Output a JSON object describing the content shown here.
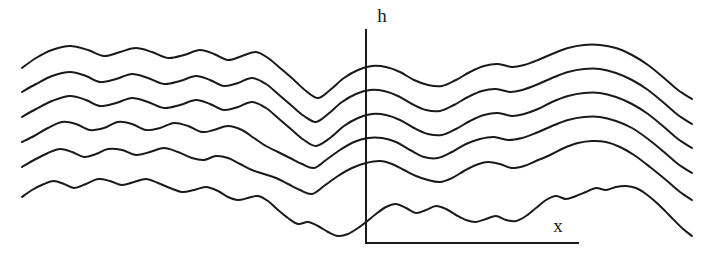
{
  "figure": {
    "type": "line-diagram",
    "background_color": "#ffffff",
    "stroke_color": "#1a1a1a",
    "stroke_width": 2,
    "width": 707,
    "height": 263
  },
  "axes": {
    "vertical": {
      "label": "h",
      "label_x": 382,
      "label_y": 22,
      "x": 366,
      "y_top": 30,
      "y_bottom": 243
    },
    "horizontal": {
      "label": "x",
      "label_x": 558,
      "label_y": 232,
      "y": 243,
      "x_left": 366,
      "x_right": 578
    }
  },
  "chart_data": {
    "type": "line",
    "title": "",
    "xlabel": "x",
    "ylabel": "h",
    "grid": false,
    "legend": null,
    "n_series": 6,
    "x_range": [
      20,
      692
    ],
    "y_range": [
      40,
      240
    ],
    "vertical_offset_between_series": 24,
    "series": [
      {
        "name": "profile-1",
        "points": [
          [
            22,
            68
          ],
          [
            36,
            58
          ],
          [
            52,
            50
          ],
          [
            70,
            46
          ],
          [
            88,
            50
          ],
          [
            104,
            56
          ],
          [
            120,
            52
          ],
          [
            136,
            48
          ],
          [
            152,
            52
          ],
          [
            168,
            58
          ],
          [
            184,
            55
          ],
          [
            200,
            50
          ],
          [
            214,
            54
          ],
          [
            228,
            60
          ],
          [
            242,
            56
          ],
          [
            256,
            52
          ],
          [
            268,
            58
          ],
          [
            280,
            68
          ],
          [
            294,
            80
          ],
          [
            306,
            91
          ],
          [
            318,
            98
          ],
          [
            330,
            90
          ],
          [
            344,
            78
          ],
          [
            358,
            70
          ],
          [
            372,
            66
          ],
          [
            386,
            67
          ],
          [
            400,
            72
          ],
          [
            414,
            80
          ],
          [
            428,
            85
          ],
          [
            442,
            86
          ],
          [
            456,
            80
          ],
          [
            470,
            72
          ],
          [
            484,
            66
          ],
          [
            498,
            64
          ],
          [
            512,
            67
          ],
          [
            524,
            65
          ],
          [
            538,
            60
          ],
          [
            552,
            54
          ],
          [
            568,
            48
          ],
          [
            584,
            45
          ],
          [
            600,
            45
          ],
          [
            616,
            48
          ],
          [
            632,
            55
          ],
          [
            648,
            65
          ],
          [
            664,
            78
          ],
          [
            678,
            90
          ],
          [
            692,
            99
          ]
        ]
      },
      {
        "name": "profile-2",
        "points": [
          [
            22,
            92
          ],
          [
            36,
            84
          ],
          [
            52,
            76
          ],
          [
            70,
            72
          ],
          [
            86,
            76
          ],
          [
            100,
            82
          ],
          [
            116,
            79
          ],
          [
            132,
            74
          ],
          [
            148,
            78
          ],
          [
            164,
            84
          ],
          [
            180,
            81
          ],
          [
            196,
            76
          ],
          [
            210,
            80
          ],
          [
            224,
            86
          ],
          [
            238,
            83
          ],
          [
            252,
            78
          ],
          [
            266,
            84
          ],
          [
            278,
            94
          ],
          [
            292,
            106
          ],
          [
            304,
            116
          ],
          [
            316,
            122
          ],
          [
            328,
            114
          ],
          [
            342,
            102
          ],
          [
            356,
            94
          ],
          [
            370,
            90
          ],
          [
            384,
            91
          ],
          [
            398,
            96
          ],
          [
            412,
            104
          ],
          [
            426,
            110
          ],
          [
            440,
            111
          ],
          [
            454,
            105
          ],
          [
            468,
            97
          ],
          [
            482,
            91
          ],
          [
            496,
            89
          ],
          [
            510,
            92
          ],
          [
            522,
            90
          ],
          [
            536,
            85
          ],
          [
            552,
            78
          ],
          [
            568,
            72
          ],
          [
            584,
            69
          ],
          [
            600,
            69
          ],
          [
            616,
            73
          ],
          [
            632,
            80
          ],
          [
            648,
            90
          ],
          [
            664,
            103
          ],
          [
            678,
            115
          ],
          [
            692,
            124
          ]
        ]
      },
      {
        "name": "profile-3",
        "points": [
          [
            22,
            117
          ],
          [
            36,
            109
          ],
          [
            52,
            101
          ],
          [
            70,
            96
          ],
          [
            86,
            100
          ],
          [
            100,
            106
          ],
          [
            116,
            103
          ],
          [
            132,
            98
          ],
          [
            148,
            102
          ],
          [
            164,
            108
          ],
          [
            180,
            105
          ],
          [
            196,
            100
          ],
          [
            210,
            104
          ],
          [
            224,
            110
          ],
          [
            238,
            107
          ],
          [
            252,
            102
          ],
          [
            266,
            108
          ],
          [
            278,
            118
          ],
          [
            292,
            130
          ],
          [
            304,
            140
          ],
          [
            316,
            146
          ],
          [
            330,
            138
          ],
          [
            344,
            126
          ],
          [
            358,
            118
          ],
          [
            372,
            114
          ],
          [
            386,
            115
          ],
          [
            400,
            120
          ],
          [
            414,
            128
          ],
          [
            428,
            134
          ],
          [
            442,
            135
          ],
          [
            456,
            129
          ],
          [
            470,
            121
          ],
          [
            484,
            115
          ],
          [
            498,
            113
          ],
          [
            512,
            116
          ],
          [
            524,
            114
          ],
          [
            538,
            109
          ],
          [
            552,
            102
          ],
          [
            568,
            96
          ],
          [
            584,
            93
          ],
          [
            600,
            93
          ],
          [
            616,
            97
          ],
          [
            632,
            104
          ],
          [
            648,
            114
          ],
          [
            664,
            127
          ],
          [
            678,
            139
          ],
          [
            692,
            148
          ]
        ]
      },
      {
        "name": "profile-4",
        "points": [
          [
            22,
            142
          ],
          [
            34,
            136
          ],
          [
            48,
            128
          ],
          [
            62,
            122
          ],
          [
            76,
            124
          ],
          [
            90,
            130
          ],
          [
            104,
            128
          ],
          [
            118,
            122
          ],
          [
            132,
            124
          ],
          [
            146,
            130
          ],
          [
            160,
            128
          ],
          [
            174,
            123
          ],
          [
            188,
            126
          ],
          [
            202,
            132
          ],
          [
            214,
            130
          ],
          [
            228,
            126
          ],
          [
            242,
            130
          ],
          [
            254,
            138
          ],
          [
            266,
            146
          ],
          [
            278,
            152
          ],
          [
            290,
            158
          ],
          [
            302,
            164
          ],
          [
            314,
            168
          ],
          [
            326,
            160
          ],
          [
            340,
            150
          ],
          [
            354,
            142
          ],
          [
            368,
            138
          ],
          [
            382,
            138
          ],
          [
            396,
            142
          ],
          [
            410,
            150
          ],
          [
            424,
            157
          ],
          [
            438,
            158
          ],
          [
            452,
            152
          ],
          [
            466,
            144
          ],
          [
            480,
            139
          ],
          [
            494,
            137
          ],
          [
            508,
            140
          ],
          [
            522,
            138
          ],
          [
            536,
            133
          ],
          [
            552,
            126
          ],
          [
            568,
            120
          ],
          [
            584,
            117
          ],
          [
            600,
            117
          ],
          [
            616,
            121
          ],
          [
            632,
            128
          ],
          [
            648,
            139
          ],
          [
            664,
            152
          ],
          [
            678,
            164
          ],
          [
            692,
            173
          ]
        ]
      },
      {
        "name": "profile-5",
        "points": [
          [
            22,
            167
          ],
          [
            34,
            160
          ],
          [
            48,
            153
          ],
          [
            60,
            149
          ],
          [
            72,
            152
          ],
          [
            84,
            157
          ],
          [
            96,
            154
          ],
          [
            108,
            149
          ],
          [
            122,
            150
          ],
          [
            136,
            155
          ],
          [
            150,
            152
          ],
          [
            164,
            148
          ],
          [
            178,
            152
          ],
          [
            192,
            158
          ],
          [
            204,
            160
          ],
          [
            216,
            156
          ],
          [
            228,
            158
          ],
          [
            240,
            164
          ],
          [
            252,
            170
          ],
          [
            264,
            174
          ],
          [
            276,
            178
          ],
          [
            288,
            184
          ],
          [
            300,
            190
          ],
          [
            312,
            194
          ],
          [
            324,
            186
          ],
          [
            338,
            176
          ],
          [
            352,
            168
          ],
          [
            366,
            163
          ],
          [
            380,
            161
          ],
          [
            392,
            164
          ],
          [
            404,
            170
          ],
          [
            416,
            176
          ],
          [
            428,
            180
          ],
          [
            440,
            182
          ],
          [
            452,
            178
          ],
          [
            464,
            171
          ],
          [
            476,
            165
          ],
          [
            488,
            162
          ],
          [
            500,
            164
          ],
          [
            512,
            168
          ],
          [
            524,
            166
          ],
          [
            536,
            161
          ],
          [
            550,
            155
          ],
          [
            564,
            148
          ],
          [
            578,
            143
          ],
          [
            592,
            141
          ],
          [
            606,
            142
          ],
          [
            620,
            147
          ],
          [
            634,
            155
          ],
          [
            650,
            167
          ],
          [
            666,
            180
          ],
          [
            680,
            192
          ],
          [
            692,
            200
          ]
        ]
      },
      {
        "name": "profile-6",
        "points": [
          [
            22,
            197
          ],
          [
            32,
            190
          ],
          [
            44,
            184
          ],
          [
            54,
            181
          ],
          [
            64,
            184
          ],
          [
            74,
            188
          ],
          [
            86,
            184
          ],
          [
            98,
            179
          ],
          [
            110,
            181
          ],
          [
            122,
            185
          ],
          [
            134,
            182
          ],
          [
            146,
            179
          ],
          [
            158,
            183
          ],
          [
            170,
            188
          ],
          [
            182,
            192
          ],
          [
            194,
            190
          ],
          [
            206,
            187
          ],
          [
            218,
            191
          ],
          [
            228,
            197
          ],
          [
            238,
            200
          ],
          [
            248,
            198
          ],
          [
            258,
            196
          ],
          [
            268,
            201
          ],
          [
            278,
            210
          ],
          [
            288,
            218
          ],
          [
            298,
            224
          ],
          [
            308,
            222
          ],
          [
            318,
            226
          ],
          [
            328,
            232
          ],
          [
            338,
            236
          ],
          [
            348,
            234
          ],
          [
            358,
            228
          ],
          [
            366,
            222
          ],
          [
            376,
            214
          ],
          [
            386,
            207
          ],
          [
            396,
            204
          ],
          [
            406,
            208
          ],
          [
            416,
            213
          ],
          [
            426,
            210
          ],
          [
            436,
            206
          ],
          [
            446,
            209
          ],
          [
            456,
            215
          ],
          [
            466,
            220
          ],
          [
            476,
            222
          ],
          [
            486,
            219
          ],
          [
            496,
            216
          ],
          [
            506,
            220
          ],
          [
            516,
            221
          ],
          [
            526,
            216
          ],
          [
            536,
            208
          ],
          [
            546,
            200
          ],
          [
            556,
            196
          ],
          [
            566,
            199
          ],
          [
            576,
            196
          ],
          [
            586,
            192
          ],
          [
            596,
            188
          ],
          [
            606,
            190
          ],
          [
            616,
            187
          ],
          [
            626,
            186
          ],
          [
            636,
            188
          ],
          [
            646,
            194
          ],
          [
            658,
            204
          ],
          [
            670,
            216
          ],
          [
            682,
            228
          ],
          [
            692,
            236
          ]
        ]
      }
    ]
  }
}
